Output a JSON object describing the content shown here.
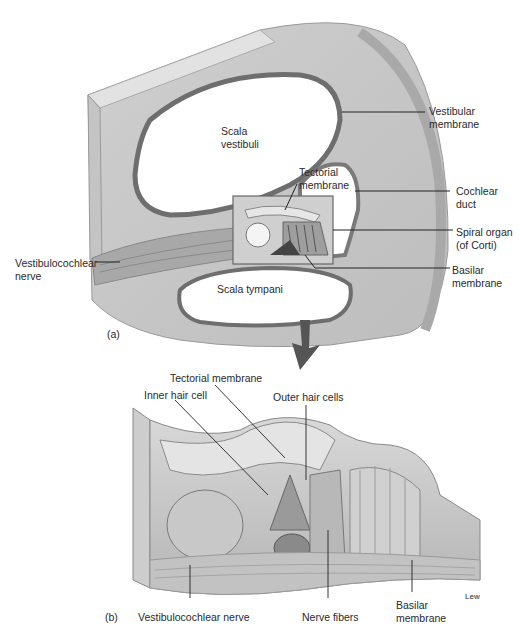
{
  "panel_a": {
    "tag": "(a)",
    "labels": {
      "scala_vestibuli": "Scala\nvestibuli",
      "vestibular_membrane": "Vestibular\nmembrane",
      "tectorial_membrane": "Tectorial\nmembrane",
      "cochlear_duct": "Cochlear\nduct",
      "spiral_organ": "Spiral organ\n(of Corti)",
      "vestibulocochlear_nerve": "Vestibulocochlear\nnerve",
      "scala_tympani": "Scala tympani",
      "basilar_membrane": "Basilar\nmembrane"
    }
  },
  "panel_b": {
    "tag": "(b)",
    "labels": {
      "tectorial_membrane": "Tectorial membrane",
      "inner_hair_cell": "Inner hair cell",
      "outer_hair_cells": "Outer hair cells",
      "vestibulocochlear_nerve": "Vestibulocochlear nerve",
      "nerve_fibers": "Nerve fibers",
      "basilar_membrane": "Basilar\nmembrane"
    },
    "artist_signature": "Lew"
  },
  "colors": {
    "tissue_light": "#d9d9d9",
    "tissue_mid": "#b8b8b8",
    "tissue_dark": "#7a7a7a",
    "arrow": "#555555",
    "leader": "#222222"
  }
}
